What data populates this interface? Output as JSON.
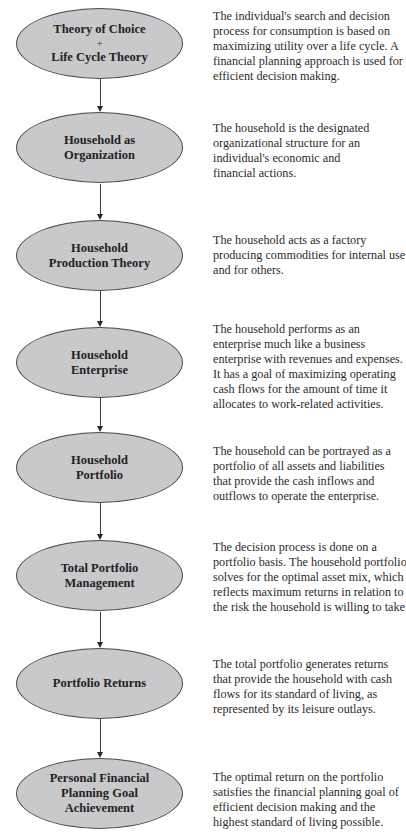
{
  "diagram": {
    "type": "vertical-flowchart",
    "colors": {
      "node_fill": "#c9c9cb",
      "node_border": "#4a4a4a",
      "arrow": "#3a3a3a",
      "text": "#2b2b2b",
      "background": "#ffffff"
    },
    "nodes": [
      {
        "label_lines": [
          "Theory of Choice",
          "+",
          "Life Cycle Theory"
        ],
        "description_lines": [
          "The individual's search and decision",
          "process for consumption is based on",
          "maximizing utility over a life cycle. A",
          "financial planning approach is used for",
          "efficient decision making."
        ]
      },
      {
        "label_lines": [
          "Household as",
          "Organization"
        ],
        "description_lines": [
          "The household is the designated",
          "organizational structure for an",
          "individual's economic and",
          "financial actions."
        ]
      },
      {
        "label_lines": [
          "Household",
          "Production Theory"
        ],
        "description_lines": [
          "The household acts as a factory",
          "producing commodities for internal use",
          "and for others."
        ]
      },
      {
        "label_lines": [
          "Household",
          "Enterprise"
        ],
        "description_lines": [
          "The household performs as an",
          "enterprise much like a business",
          "enterprise with revenues and expenses.",
          "It has a goal of maximizing operating",
          "cash flows for the amount of time it",
          "allocates to work-related activities."
        ]
      },
      {
        "label_lines": [
          "Household",
          "Portfolio"
        ],
        "description_lines": [
          "The household can be portrayed as a",
          "portfolio of all assets and liabilities",
          "that provide the cash inflows and",
          "outflows to operate the enterprise."
        ]
      },
      {
        "label_lines": [
          "Total Portfolio",
          "Management"
        ],
        "description_lines": [
          "The decision process is done on a",
          "portfolio basis. The household portfolio",
          "solves for the optimal asset mix, which",
          "reflects maximum returns in relation to",
          "the risk the household is willing to take."
        ]
      },
      {
        "label_lines": [
          "Portfolio Returns"
        ],
        "description_lines": [
          "The total portfolio generates returns",
          "that provide the household with cash",
          "flows for its standard of living, as",
          "represented by its leisure outlays."
        ]
      },
      {
        "label_lines": [
          "Personal Financial",
          "Planning Goal",
          "Achievement"
        ],
        "description_lines": [
          "The optimal return on the portfolio",
          "satisfies the financial planning goal of",
          "efficient decision making and the",
          "highest standard of living possible."
        ]
      }
    ],
    "edges": [
      {
        "from": 0,
        "to": 1
      },
      {
        "from": 1,
        "to": 2
      },
      {
        "from": 2,
        "to": 3
      },
      {
        "from": 3,
        "to": 4
      },
      {
        "from": 4,
        "to": 5
      },
      {
        "from": 5,
        "to": 6
      },
      {
        "from": 6,
        "to": 7
      }
    ]
  }
}
